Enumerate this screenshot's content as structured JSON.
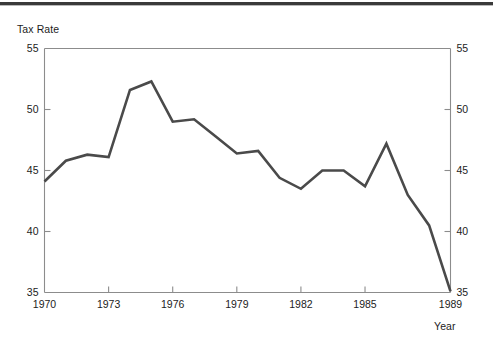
{
  "figure": {
    "name": "tax-rate-line-chart",
    "background_color": "#ffffff",
    "rule_color": "#3a3a3a",
    "line_color": "#4a4a4a",
    "axis_color": "#8c8c8c",
    "text_color": "#1c1c1c"
  },
  "chart_data": {
    "type": "line",
    "title": "",
    "subtitle": "",
    "xlabel": "Year",
    "ylabel": "Tax Rate",
    "ylabel_position": "top-left",
    "xlabel_position": "bottom-right",
    "grid": false,
    "legend": false,
    "legend_position": "none",
    "xlim": [
      1970,
      1989
    ],
    "ylim": [
      35,
      55
    ],
    "y_ticks": [
      35,
      40,
      45,
      50,
      55
    ],
    "y_tick_labels": [
      "35",
      "40",
      "45",
      "50",
      "55"
    ],
    "y_axis_right_mirrored": true,
    "y_ticks_right": [
      35,
      40,
      45,
      50,
      55
    ],
    "y_tick_labels_right": [
      "35",
      "40",
      "45",
      "50",
      "55"
    ],
    "x_ticks": [
      1970,
      1973,
      1976,
      1979,
      1982,
      1985,
      1989
    ],
    "x_tick_labels": [
      "1970",
      "1973",
      "1976",
      "1979",
      "1982",
      "1985",
      "1989"
    ],
    "x": [
      1970,
      1971,
      1972,
      1973,
      1974,
      1975,
      1976,
      1977,
      1978,
      1979,
      1980,
      1981,
      1982,
      1983,
      1984,
      1985,
      1986,
      1987,
      1988,
      1989
    ],
    "values": [
      44.1,
      45.8,
      46.3,
      46.1,
      51.6,
      52.3,
      49.0,
      49.2,
      47.8,
      46.4,
      46.6,
      44.4,
      43.5,
      45.0,
      45.0,
      43.7,
      47.2,
      43.0,
      40.5,
      35.1
    ],
    "series": [
      {
        "name": "Tax Rate",
        "color": "#4a4a4a",
        "line_width": 2.6,
        "values": [
          44.1,
          45.8,
          46.3,
          46.1,
          51.6,
          52.3,
          49.0,
          49.2,
          47.8,
          46.4,
          46.6,
          44.4,
          43.5,
          45.0,
          45.0,
          43.7,
          47.2,
          43.0,
          40.5,
          35.1
        ]
      }
    ],
    "annotations": []
  }
}
